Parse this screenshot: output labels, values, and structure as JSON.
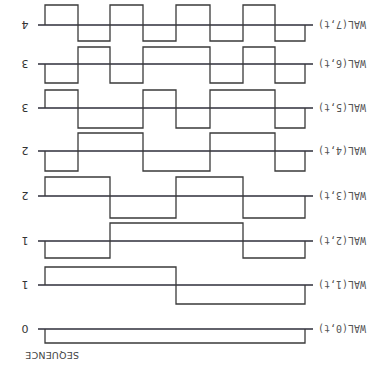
{
  "diagram": {
    "orientation_deg": 180,
    "column_header": "SEQUENCE",
    "colors": {
      "line": "#3a3a3a",
      "axis": "#2e2e3a",
      "text": "#555555",
      "seq_zero": "#2a4a8a"
    },
    "time_edges_px": [
      45,
      78,
      110,
      143,
      176,
      210,
      243,
      275,
      305
    ],
    "axis_end_px": 313,
    "rows": [
      {
        "label": "WAL(7,t)",
        "sequency": "4",
        "axis_y": 25,
        "up_y": 5,
        "down_y": 41,
        "pattern": [
          "U",
          "D",
          "U",
          "D",
          "U",
          "D",
          "U",
          "D"
        ]
      },
      {
        "label": "WAL(6,t)",
        "sequency": "3",
        "axis_y": 64,
        "up_y": 47,
        "down_y": 83,
        "pattern": [
          "D",
          "U",
          "D",
          "U",
          "U",
          "D",
          "U",
          "D"
        ]
      },
      {
        "label": "WAL(5,t)",
        "sequency": "3",
        "axis_y": 108,
        "up_y": 90,
        "down_y": 128,
        "pattern": [
          "U",
          "D",
          "D",
          "U",
          "D",
          "U",
          "U",
          "D"
        ]
      },
      {
        "label": "WAL(4,t)",
        "sequency": "2",
        "axis_y": 151,
        "up_y": 133,
        "down_y": 171,
        "pattern": [
          "D",
          "U",
          "U",
          "D",
          "D",
          "U",
          "U",
          "D"
        ]
      },
      {
        "label": "WAL(3,t)",
        "sequency": "2",
        "axis_y": 196,
        "up_y": 177,
        "down_y": 218,
        "pattern": [
          "U",
          "U",
          "D",
          "D",
          "U",
          "U",
          "D",
          "D"
        ]
      },
      {
        "label": "WAL(2,t)",
        "sequency": "1",
        "axis_y": 241,
        "up_y": 223,
        "down_y": 258,
        "pattern": [
          "D",
          "D",
          "U",
          "U",
          "U",
          "U",
          "D",
          "D"
        ]
      },
      {
        "label": "WAL(1,t)",
        "sequency": "1",
        "axis_y": 285,
        "up_y": 267,
        "down_y": 304,
        "pattern": [
          "U",
          "U",
          "U",
          "U",
          "D",
          "D",
          "D",
          "D"
        ]
      },
      {
        "label": "WAL(0,t)",
        "sequency": "0",
        "axis_y": 329,
        "up_y": 343,
        "down_y": 343,
        "pattern": [
          "D",
          "D",
          "D",
          "D",
          "D",
          "D",
          "D",
          "D"
        ]
      }
    ]
  }
}
